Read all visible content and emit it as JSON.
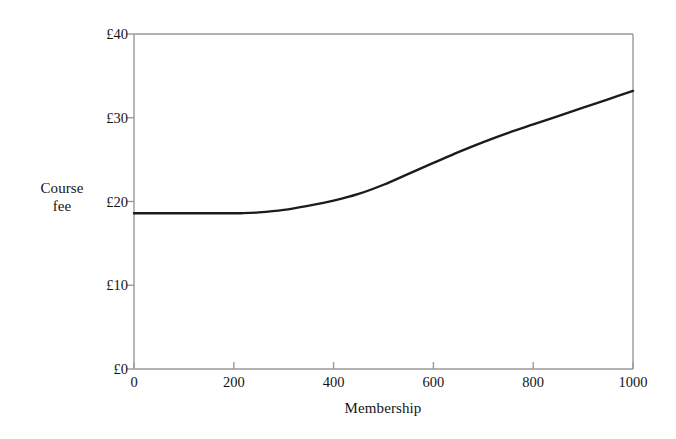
{
  "chart_data": {
    "type": "line",
    "title": "",
    "subtitle": "",
    "xlabel": "Membership",
    "ylabel": "Course\nfee",
    "xlim": [
      0,
      1000
    ],
    "ylim": [
      0,
      40
    ],
    "grid": false,
    "legend": null,
    "xticks": [
      0,
      200,
      400,
      600,
      800,
      1000
    ],
    "xtick_labels": [
      "0",
      "200",
      "400",
      "600",
      "800",
      "1000"
    ],
    "yticks": [
      0,
      10,
      20,
      30,
      40
    ],
    "ytick_labels": [
      "£0",
      "£10",
      "£20",
      "£30",
      "£40"
    ],
    "series": [
      {
        "name": "Course fee",
        "color": "#1c1c1c",
        "linewidth": 2.4,
        "x": [
          0,
          50,
          100,
          150,
          200,
          215,
          250,
          300,
          350,
          400,
          450,
          500,
          550,
          600,
          650,
          700,
          750,
          800,
          850,
          900,
          950,
          1000
        ],
        "y": [
          18.6,
          18.6,
          18.6,
          18.6,
          18.6,
          18.6,
          18.7,
          19.0,
          19.5,
          20.1,
          20.9,
          22.0,
          23.3,
          24.6,
          25.9,
          27.1,
          28.2,
          29.2,
          30.2,
          31.2,
          32.2,
          33.2
        ]
      }
    ],
    "annotations": []
  },
  "axes": {
    "spine_color": "#9a9a9a",
    "tick_color": "#9a9a9a",
    "background": "#ffffff"
  }
}
